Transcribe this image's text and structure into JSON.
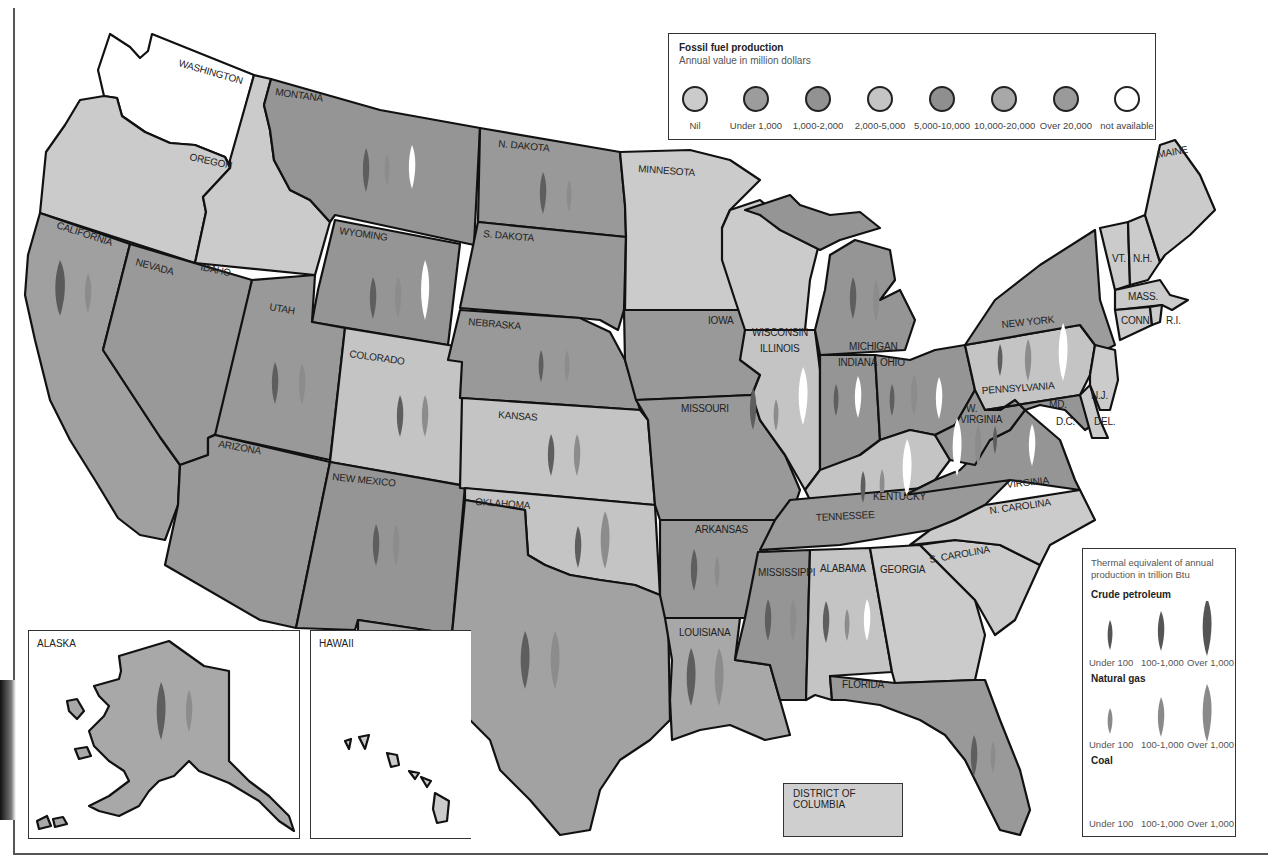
{
  "title_legend": {
    "title": "Fossil fuel production",
    "subtitle": "Annual value in million dollars",
    "classes": [
      {
        "label": "Nil",
        "color": "#cbcbcb"
      },
      {
        "label": "Under 1,000",
        "color": "#9c9c9c"
      },
      {
        "label": "1,000-2,000",
        "color": "#929292"
      },
      {
        "label": "2,000-5,000",
        "color": "#c4c4c4"
      },
      {
        "label": "5,000-10,000",
        "color": "#8f8f8f"
      },
      {
        "label": "10,000-20,000",
        "color": "#a8a8a8"
      },
      {
        "label": "Over 20,000",
        "color": "#9a9a9a"
      },
      {
        "label": "not available",
        "color": "#ffffff"
      }
    ]
  },
  "symbol_legend": {
    "title": "Thermal equivalent of annual production in trillion Btu",
    "crude_petroleum": {
      "label": "Crude petroleum",
      "color": "#5a5a5a",
      "sizes": [
        "Under 100",
        "100-1,000",
        "Over 1,000"
      ]
    },
    "natural_gas": {
      "label": "Natural gas",
      "color": "#8a8a8a",
      "sizes": [
        "Under 100",
        "100-1,000",
        "Over 1,000"
      ]
    },
    "coal": {
      "label": "Coal",
      "color": "#ffffff",
      "sizes": [
        "Under 100",
        "100-1,000",
        "Over 1,000"
      ]
    }
  },
  "labels": {
    "washington": "WASHINGTON",
    "oregon": "OREGON",
    "california": "CALIFORNIA",
    "nevada": "NEVADA",
    "idaho": "IDAHO",
    "montana": "MONTANA",
    "wyoming": "WYOMING",
    "utah": "UTAH",
    "arizona": "ARIZONA",
    "colorado": "COLORADO",
    "new_mexico": "NEW MEXICO",
    "n_dakota": "N. DAKOTA",
    "s_dakota": "S. DAKOTA",
    "nebraska": "NEBRASKA",
    "kansas": "KANSAS",
    "oklahoma": "OKLAHOMA",
    "texas": "TEXAS",
    "minnesota": "MINNESOTA",
    "iowa": "IOWA",
    "missouri": "MISSOURI",
    "arkansas": "ARKANSAS",
    "louisiana": "LOUISIANA",
    "wisconsin": "WISCONSIN",
    "illinois": "ILLINOIS",
    "michigan": "MICHIGAN",
    "indiana": "INDIANA",
    "ohio": "OHIO",
    "kentucky": "KENTUCKY",
    "tennessee": "TENNESSEE",
    "mississippi": "MISSISSIPPI",
    "alabama": "ALABAMA",
    "georgia": "GEORGIA",
    "florida": "FLORIDA",
    "s_carolina": "S. CAROLINA",
    "n_carolina": "N. CAROLINA",
    "virginia": "VIRGINIA",
    "w_virginia_1": "W.",
    "w_virginia_2": "VIRGINIA",
    "pennsylvania": "PENNSYLVANIA",
    "new_york": "NEW YORK",
    "maine": "MAINE",
    "vt": "VT.",
    "nh": "N.H.",
    "mass": "MASS.",
    "conn": "CONN.",
    "ri": "R.I.",
    "nj": "N.J.",
    "del": "DEL.",
    "md": "MD.",
    "dc": "D.C.",
    "alaska": "ALASKA",
    "hawaii": "HAWAII",
    "district_of_columbia": "DISTRICT OF COLUMBIA"
  },
  "state_data": [
    {
      "state": "Washington",
      "class": "not available",
      "petroleum": null,
      "gas": null,
      "coal": null
    },
    {
      "state": "Oregon",
      "class": "Nil"
    },
    {
      "state": "Idaho",
      "class": "Nil"
    },
    {
      "state": "California",
      "class": "5,000-10,000",
      "petroleum": "Over 1,000",
      "gas": "100-1,000"
    },
    {
      "state": "Nevada",
      "class": "Under 1,000"
    },
    {
      "state": "Montana",
      "class": "1,000-2,000",
      "petroleum": "100-1,000",
      "gas": "Under 100",
      "coal": "100-1,000"
    },
    {
      "state": "Wyoming",
      "class": "1,000-2,000",
      "petroleum": "100-1,000",
      "gas": "100-1,000",
      "coal": "Over 1,000"
    },
    {
      "state": "Utah",
      "class": "Under 1,000",
      "petroleum": "100-1,000",
      "gas": "100-1,000"
    },
    {
      "state": "Colorado",
      "class": "2,000-5,000",
      "petroleum": "100-1,000",
      "gas": "100-1,000"
    },
    {
      "state": "Arizona",
      "class": "Under 1,000"
    },
    {
      "state": "New Mexico",
      "class": "1,000-2,000",
      "petroleum": "100-1,000",
      "gas": "100-1,000"
    },
    {
      "state": "N. Dakota",
      "class": "Under 1,000",
      "petroleum": "100-1,000",
      "gas": "Under 100"
    },
    {
      "state": "S. Dakota",
      "class": "Under 1,000"
    },
    {
      "state": "Nebraska",
      "class": "Under 1,000",
      "petroleum": "Under 100",
      "gas": "Under 100"
    },
    {
      "state": "Kansas",
      "class": "2,000-5,000",
      "petroleum": "100-1,000",
      "gas": "100-1,000"
    },
    {
      "state": "Oklahoma",
      "class": "2,000-5,000",
      "petroleum": "100-1,000",
      "gas": "Over 1,000"
    },
    {
      "state": "Texas",
      "class": "Over 20,000",
      "petroleum": "Over 1,000",
      "gas": "Over 1,000"
    },
    {
      "state": "Minnesota",
      "class": "Nil"
    },
    {
      "state": "Iowa",
      "class": "Under 1,000"
    },
    {
      "state": "Missouri",
      "class": "Under 1,000"
    },
    {
      "state": "Arkansas",
      "class": "Under 1,000",
      "petroleum": "100-1,000",
      "gas": "Under 100"
    },
    {
      "state": "Louisiana",
      "class": "10,000-20,000",
      "petroleum": "Over 1,000",
      "gas": "Over 1,000"
    },
    {
      "state": "Wisconsin",
      "class": "Nil"
    },
    {
      "state": "Illinois",
      "class": "2,000-5,000",
      "petroleum": "100-1,000",
      "gas": "Under 100",
      "coal": "Over 1,000"
    },
    {
      "state": "Michigan",
      "class": "1,000-2,000",
      "petroleum": "100-1,000",
      "gas": "100-1,000"
    },
    {
      "state": "Indiana",
      "class": "1,000-2,000",
      "petroleum": "Under 100",
      "coal": "100-1,000"
    },
    {
      "state": "Ohio",
      "class": "1,000-2,000",
      "petroleum": "Under 100",
      "gas": "100-1,000",
      "coal": "100-1,000"
    },
    {
      "state": "Kentucky",
      "class": "2,000-5,000",
      "petroleum": "Under 100",
      "gas": "Under 100",
      "coal": "Over 1,000"
    },
    {
      "state": "W. Virginia",
      "class": "1,000-2,000",
      "gas": "100-1,000",
      "coal": "Over 1,000"
    },
    {
      "state": "Virginia",
      "class": "1,000-2,000",
      "coal": "100-1,000"
    },
    {
      "state": "Pennsylvania",
      "class": "2,000-5,000",
      "petroleum": "Under 100",
      "gas": "100-1,000",
      "coal": "Over 1,000"
    },
    {
      "state": "New York",
      "class": "Under 1,000"
    },
    {
      "state": "Tennessee",
      "class": "Under 1,000"
    },
    {
      "state": "Mississippi",
      "class": "1,000-2,000",
      "petroleum": "100-1,000",
      "gas": "100-1,000"
    },
    {
      "state": "Alabama",
      "class": "2,000-5,000",
      "petroleum": "100-1,000",
      "gas": "Under 100",
      "coal": "100-1,000"
    },
    {
      "state": "Georgia",
      "class": "Nil"
    },
    {
      "state": "Florida",
      "class": "1,000-2,000",
      "petroleum": "100-1,000",
      "gas": "Under 100"
    },
    {
      "state": "S. Carolina",
      "class": "Nil"
    },
    {
      "state": "N. Carolina",
      "class": "Nil"
    },
    {
      "state": "Alaska",
      "class": "10,000-20,000",
      "petroleum": "Over 1,000",
      "gas": "100-1,000"
    },
    {
      "state": "Hawaii",
      "class": "Nil"
    },
    {
      "state": "District of Columbia",
      "class": "Nil"
    }
  ]
}
